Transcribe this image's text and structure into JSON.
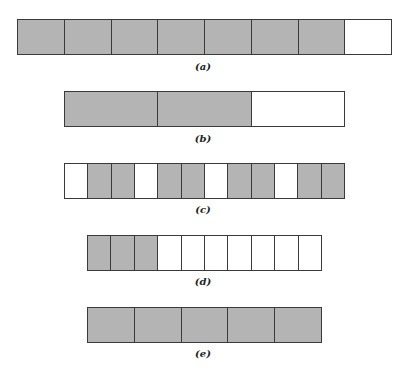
{
  "colors": {
    "shaded": "#b4b4b4",
    "empty": "#ffffff",
    "border": "#3a3a3a"
  },
  "strips": [
    {
      "label": "(a)",
      "cells": [
        "S",
        "S",
        "S",
        "S",
        "S",
        "S",
        "S",
        "W"
      ],
      "shaded_count": 7,
      "total_cells": 8
    },
    {
      "label": "(b)",
      "cells": [
        "S",
        "S",
        "W"
      ],
      "shaded_count": 2,
      "total_cells": 3
    },
    {
      "label": "(c)",
      "cells": [
        "W",
        "S",
        "S",
        "W",
        "S",
        "S",
        "W",
        "S",
        "S",
        "W",
        "S",
        "S"
      ],
      "shaded_count": 8,
      "total_cells": 12
    },
    {
      "label": "(d)",
      "cells": [
        "S",
        "S",
        "S",
        "W",
        "W",
        "W",
        "W",
        "W",
        "W",
        "W"
      ],
      "shaded_count": 3,
      "total_cells": 10
    },
    {
      "label": "(e)",
      "cells": [
        "S",
        "S",
        "S",
        "S",
        "S"
      ],
      "shaded_count": 5,
      "total_cells": 5
    }
  ]
}
